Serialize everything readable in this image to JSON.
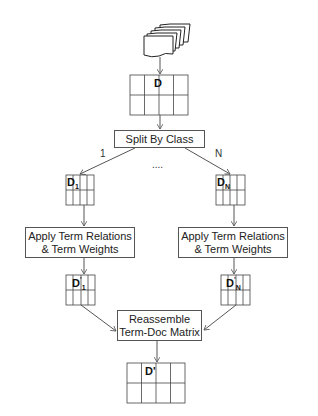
{
  "source_docs": {
    "icon": "document-stack-icon"
  },
  "matrices": {
    "d": "D",
    "d1": {
      "base": "D",
      "sub": "1"
    },
    "dn": {
      "base": "D",
      "sub": "N"
    },
    "d1p": {
      "base": "D",
      "sup": "'",
      "sub": "1"
    },
    "dnp": {
      "base": "D",
      "sup": "'",
      "sub": "N"
    },
    "dfinal": "D'"
  },
  "steps": {
    "split": "Split By Class",
    "apply_left_1": "Apply Term Relations",
    "apply_left_2": "& Term Weights",
    "apply_right_1": "Apply Term Relations",
    "apply_right_2": "& Term Weights",
    "reassemble_1": "Reassemble",
    "reassemble_2": "Term-Doc Matrix"
  },
  "branch_labels": {
    "left": "1",
    "middle": "....",
    "right": "N"
  }
}
